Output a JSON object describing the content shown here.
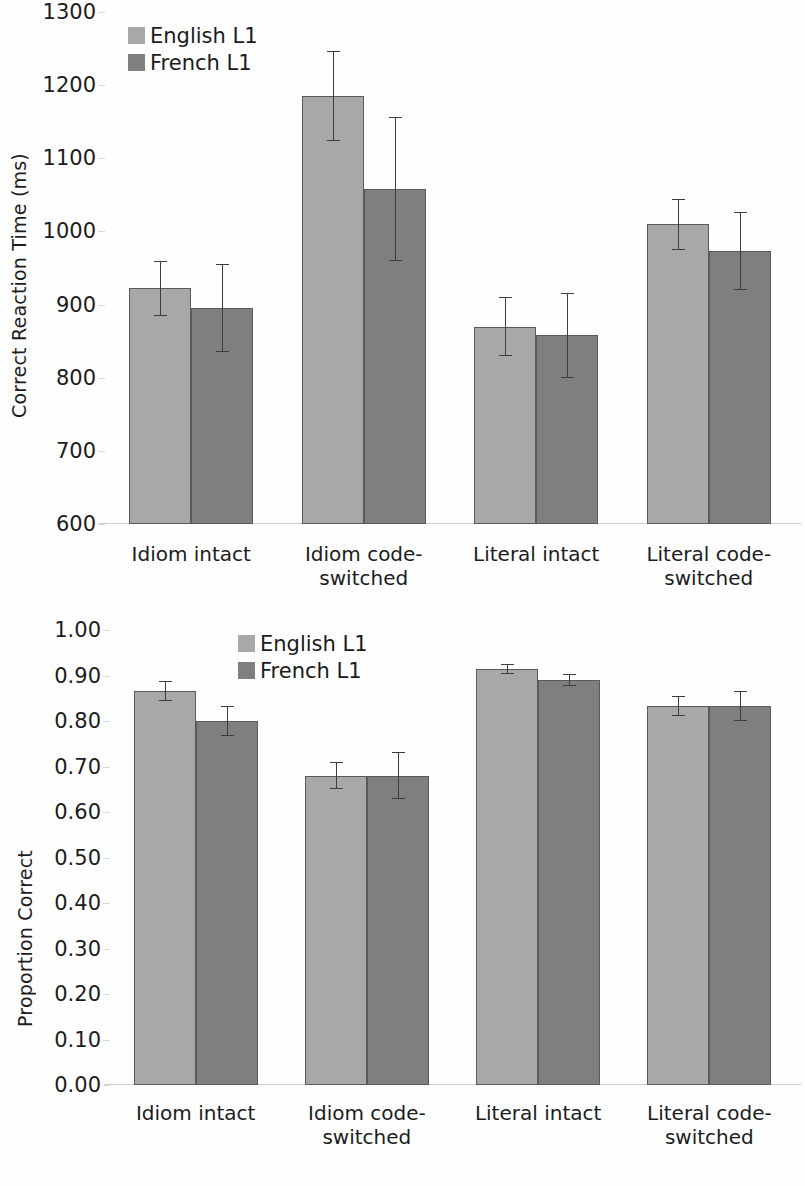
{
  "figure": {
    "panels": [
      "reaction_time",
      "proportion_correct"
    ]
  },
  "chart_data": [
    {
      "type": "bar",
      "title": "",
      "xlabel": "",
      "ylabel": "Correct Reaction Time (ms)",
      "ylim": [
        600,
        1300
      ],
      "ytick_step": 100,
      "ytick_labels": [
        "1300",
        "1200",
        "1100",
        "1000",
        "900",
        "800",
        "700",
        "600"
      ],
      "ytick_values": [
        1300,
        1200,
        1100,
        1000,
        900,
        800,
        700,
        600
      ],
      "grid": false,
      "legend_position": "top-left-inside",
      "error_bars": "standard error",
      "categories": [
        "Idiom intact",
        "Idiom code-switched",
        "Literal intact",
        "Literal code-switched"
      ],
      "category_lines": [
        [
          "Idiom intact"
        ],
        [
          "Idiom code-",
          "switched"
        ],
        [
          "Literal intact"
        ],
        [
          "Literal code-",
          "switched"
        ]
      ],
      "series": [
        {
          "name": "English L1",
          "color": "#a8a8a8",
          "values": [
            922,
            1185,
            870,
            1010
          ],
          "errors": [
            38,
            62,
            40,
            35
          ]
        },
        {
          "name": "French L1",
          "color": "#7f7f7f",
          "values": [
            895,
            1058,
            858,
            973
          ],
          "errors": [
            60,
            98,
            58,
            53
          ]
        }
      ]
    },
    {
      "type": "bar",
      "title": "",
      "xlabel": "",
      "ylabel": "Proportion Correct",
      "ylim": [
        0.0,
        1.0
      ],
      "ytick_step": 0.1,
      "ytick_labels": [
        "1.00",
        "0.90",
        "0.80",
        "0.70",
        "0.60",
        "0.50",
        "0.40",
        "0.30",
        "0.20",
        "0.10",
        "0.00"
      ],
      "ytick_values": [
        1.0,
        0.9,
        0.8,
        0.7,
        0.6,
        0.5,
        0.4,
        0.3,
        0.2,
        0.1,
        0.0
      ],
      "grid": false,
      "legend_position": "top-center-inside",
      "error_bars": "standard error",
      "categories": [
        "Idiom intact",
        "Idiom code-switched",
        "Literal intact",
        "Literal code-switched"
      ],
      "category_lines": [
        [
          "Idiom intact"
        ],
        [
          "Idiom code-",
          "switched"
        ],
        [
          "Literal intact"
        ],
        [
          "Literal code-",
          "switched"
        ]
      ],
      "series": [
        {
          "name": "English L1",
          "color": "#a8a8a8",
          "values": [
            0.865,
            0.68,
            0.915,
            0.833
          ],
          "errors": [
            0.022,
            0.03,
            0.011,
            0.023
          ]
        },
        {
          "name": "French L1",
          "color": "#7f7f7f",
          "values": [
            0.8,
            0.68,
            0.89,
            0.833
          ],
          "errors": [
            0.032,
            0.051,
            0.014,
            0.032
          ]
        }
      ]
    }
  ]
}
